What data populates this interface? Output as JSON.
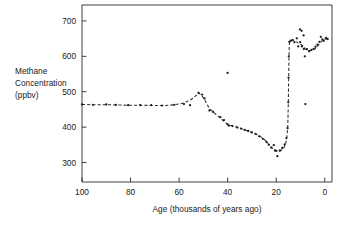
{
  "chart_data": {
    "type": "scatter",
    "title": "",
    "xlabel": "Age  (thousands of years ago)",
    "ylabel": "Methane Concentration (ppbv)",
    "ylabel_lines": [
      "Methane",
      "Concentration",
      "(ppbv)"
    ],
    "xlim": [
      100,
      -3
    ],
    "ylim": [
      245,
      745
    ],
    "xticks": [
      100,
      80,
      60,
      40,
      20,
      0
    ],
    "xtick_labels": [
      "100",
      "80",
      "60",
      "40",
      "20",
      "0"
    ],
    "yticks": [
      300,
      400,
      500,
      600,
      700
    ],
    "ytick_labels": [
      "300",
      "400",
      "500",
      "600",
      "700"
    ],
    "grid": false,
    "legend": null,
    "x_axis_reversed": true,
    "units": "ppbv",
    "series": [
      {
        "name": "Methane concentration measurements",
        "marker": "dot",
        "points": [
          [
            100.0,
            464
          ],
          [
            95.5,
            463
          ],
          [
            90.0,
            464
          ],
          [
            86.0,
            463
          ],
          [
            81.0,
            462
          ],
          [
            76.0,
            462
          ],
          [
            71.5,
            462
          ],
          [
            67.0,
            461
          ],
          [
            62.0,
            463
          ],
          [
            58.0,
            465
          ],
          [
            55.5,
            462
          ],
          [
            52.0,
            497
          ],
          [
            50.5,
            492
          ],
          [
            49.5,
            481
          ],
          [
            47.5,
            447
          ],
          [
            46.0,
            443
          ],
          [
            43.0,
            428
          ],
          [
            41.5,
            420
          ],
          [
            40.0,
            553
          ],
          [
            40.0,
            408
          ],
          [
            39.5,
            404
          ],
          [
            38.0,
            403
          ],
          [
            36.0,
            399
          ],
          [
            34.5,
            396
          ],
          [
            33.0,
            392
          ],
          [
            31.5,
            389
          ],
          [
            30.0,
            385
          ],
          [
            28.5,
            381
          ],
          [
            27.0,
            374
          ],
          [
            25.5,
            367
          ],
          [
            24.0,
            358
          ],
          [
            23.0,
            350
          ],
          [
            22.0,
            342
          ],
          [
            21.0,
            349
          ],
          [
            20.5,
            334
          ],
          [
            20.0,
            333
          ],
          [
            19.5,
            318
          ],
          [
            18.5,
            334
          ],
          [
            17.5,
            341
          ],
          [
            16.5,
            351
          ],
          [
            15.8,
            369
          ],
          [
            15.3,
            397
          ],
          [
            15.0,
            470
          ],
          [
            14.9,
            540
          ],
          [
            14.8,
            600
          ],
          [
            14.6,
            641
          ],
          [
            14.0,
            644
          ],
          [
            13.2,
            646
          ],
          [
            12.5,
            640
          ],
          [
            11.5,
            651
          ],
          [
            10.9,
            628
          ],
          [
            10.2,
            676
          ],
          [
            10.1,
            640
          ],
          [
            9.5,
            672
          ],
          [
            9.4,
            628
          ],
          [
            8.7,
            659
          ],
          [
            8.6,
            621
          ],
          [
            8.2,
            600
          ],
          [
            8.0,
            465
          ],
          [
            7.3,
            620
          ],
          [
            6.4,
            614
          ],
          [
            5.5,
            618
          ],
          [
            4.6,
            621
          ],
          [
            3.8,
            627
          ],
          [
            3.0,
            633
          ],
          [
            2.2,
            641
          ],
          [
            1.6,
            655
          ],
          [
            1.0,
            648
          ],
          [
            0.4,
            644
          ],
          [
            -0.5,
            652
          ],
          [
            -1.2,
            649
          ]
        ]
      }
    ],
    "fit_curve": {
      "name": "smoothed trend (dashed)",
      "style": "dashed",
      "points": [
        [
          100.0,
          464
        ],
        [
          94.0,
          463
        ],
        [
          88.0,
          463
        ],
        [
          82.0,
          462
        ],
        [
          76.0,
          462
        ],
        [
          70.0,
          461
        ],
        [
          66.0,
          461
        ],
        [
          62.0,
          463
        ],
        [
          58.0,
          468
        ],
        [
          55.0,
          478
        ],
        [
          52.5,
          492
        ],
        [
          52.0,
          497
        ],
        [
          50.5,
          488
        ],
        [
          49.0,
          472
        ],
        [
          47.5,
          452
        ],
        [
          46.0,
          443
        ],
        [
          44.0,
          432
        ],
        [
          42.0,
          419
        ],
        [
          40.0,
          408
        ],
        [
          38.0,
          403
        ],
        [
          36.0,
          399
        ],
        [
          34.0,
          395
        ],
        [
          32.0,
          390
        ],
        [
          30.0,
          385
        ],
        [
          28.0,
          379
        ],
        [
          26.0,
          371
        ],
        [
          24.0,
          360
        ],
        [
          23.0,
          351
        ],
        [
          22.0,
          343
        ],
        [
          21.0,
          337
        ],
        [
          20.0,
          333
        ],
        [
          19.0,
          331
        ],
        [
          18.0,
          334
        ],
        [
          17.0,
          340
        ],
        [
          16.2,
          350
        ],
        [
          15.6,
          371
        ],
        [
          15.2,
          405
        ],
        [
          15.0,
          470
        ],
        [
          14.85,
          545
        ],
        [
          14.7,
          605
        ],
        [
          14.55,
          637
        ],
        [
          14.2,
          644
        ],
        [
          13.0,
          646
        ],
        [
          12.0,
          642
        ],
        [
          11.0,
          638
        ],
        [
          10.0,
          634
        ],
        [
          9.0,
          630
        ],
        [
          8.0,
          621
        ],
        [
          7.0,
          617
        ],
        [
          6.0,
          616
        ],
        [
          5.0,
          617
        ],
        [
          4.0,
          621
        ],
        [
          3.0,
          628
        ],
        [
          2.0,
          637
        ],
        [
          1.0,
          645
        ],
        [
          0.0,
          648
        ],
        [
          -1.2,
          650
        ]
      ]
    },
    "annotations": [
      {
        "text": "high outlier near 40 ka",
        "x": 40,
        "y": 553
      },
      {
        "text": "low outlier near 19.5 ka",
        "x": 19.5,
        "y": 318
      },
      {
        "text": "low outlier near 8 ka",
        "x": 8.0,
        "y": 465
      }
    ]
  },
  "colors": {
    "background": "#ffffff",
    "axis": "#2b2b2b",
    "marker": "#1f1f1f",
    "line": "#2b2b2b",
    "text": "#1a1a1a"
  }
}
